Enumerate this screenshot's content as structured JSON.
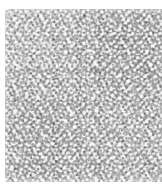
{
  "page": {
    "background_color": "#ffffff",
    "width": 162,
    "height": 194
  },
  "figure": {
    "name": "granular-grayscale-texture",
    "x": 5,
    "y": 9,
    "width": 157,
    "height": 173,
    "base_color": "#a9a9a9",
    "highlight_color": "#f5f5f5",
    "shadow_color": "#606060",
    "mean_tone": "#a8a8a8",
    "caption": "",
    "label": ""
  }
}
